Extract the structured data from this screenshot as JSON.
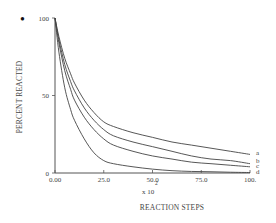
{
  "chart_data": {
    "type": "line",
    "title": "",
    "xlabel": "REACTION STEPS",
    "xlabel_multiplier": "x 10",
    "xlabel_exponent": "2",
    "ylabel": "PERCENT REACTED",
    "xlim": [
      0,
      100
    ],
    "ylim": [
      0,
      100
    ],
    "grid": false,
    "legend_position": "inline-right",
    "x_ticks": [
      "0.00",
      "25.0",
      "50.0",
      "75.0",
      "100."
    ],
    "x_tick_values": [
      0,
      25,
      50,
      75,
      100
    ],
    "y_ticks": [
      "0",
      "50",
      "100"
    ],
    "y_tick_values": [
      0,
      50,
      100
    ],
    "x": [
      0,
      2,
      5,
      8,
      10,
      15,
      20,
      25,
      30,
      40,
      50,
      60,
      70,
      80,
      90,
      100
    ],
    "series": [
      {
        "name": "a",
        "values": [
          100,
          88,
          74,
          64,
          58,
          47,
          39,
          33,
          30,
          26,
          23,
          20,
          18,
          16,
          14,
          12
        ]
      },
      {
        "name": "b",
        "values": [
          100,
          86,
          70,
          59,
          53,
          42,
          34,
          28,
          24,
          20,
          17,
          14,
          11,
          9,
          8,
          6
        ]
      },
      {
        "name": "c",
        "values": [
          100,
          84,
          66,
          54,
          47,
          36,
          28,
          22,
          18,
          14,
          11,
          9,
          7,
          6,
          5,
          4
        ]
      },
      {
        "name": "d",
        "values": [
          100,
          78,
          55,
          41,
          34,
          22,
          13,
          8,
          6,
          4,
          2.5,
          1.5,
          1,
          0.8,
          0.5,
          0.3
        ]
      }
    ]
  },
  "page": {
    "bullet": "•"
  }
}
